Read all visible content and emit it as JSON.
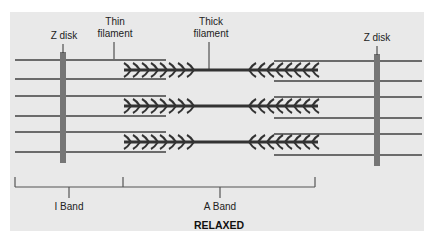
{
  "diagram": {
    "title": "RELAXED",
    "labels": {
      "z_disk_left": "Z disk",
      "z_disk_right": "Z disk",
      "thin_filament_line1": "Thin",
      "thin_filament_line2": "filament",
      "thick_filament_line1": "Thick",
      "thick_filament_line2": "filament",
      "i_band": "I Band",
      "a_band": "A Band"
    },
    "colors": {
      "background": "#e9e9e9",
      "thin_filament": "#6b6b6b",
      "z_disk": "#767676",
      "thick_filament": "#333333",
      "text": "#222222"
    },
    "thin_filament_rows_y": [
      60,
      79,
      96,
      116,
      132,
      152
    ],
    "thick_filament_rows_y": [
      70,
      106,
      142
    ]
  }
}
